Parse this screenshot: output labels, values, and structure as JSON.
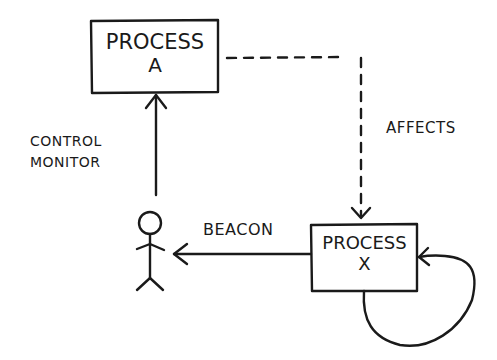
{
  "diagram": {
    "nodes": {
      "process_a": {
        "line1": "PROCESS",
        "line2": "A"
      },
      "process_x": {
        "line1": "PROCESS",
        "line2": "X"
      },
      "actor": {
        "label": ""
      }
    },
    "edges": {
      "control_monitor": {
        "line1": "CONTROL",
        "line2": "MONITOR",
        "from": "actor",
        "to": "process_a",
        "style": "solid"
      },
      "affects": {
        "label": "AFFECTS",
        "from": "process_a",
        "to": "process_x",
        "style": "dashed"
      },
      "beacon": {
        "label": "BEACON",
        "from": "process_x",
        "to": "actor",
        "style": "solid"
      },
      "self_loop": {
        "label": "",
        "from": "process_x",
        "to": "process_x",
        "style": "solid"
      }
    },
    "colors": {
      "ink": "#1a1a1a",
      "background": "#ffffff"
    }
  }
}
